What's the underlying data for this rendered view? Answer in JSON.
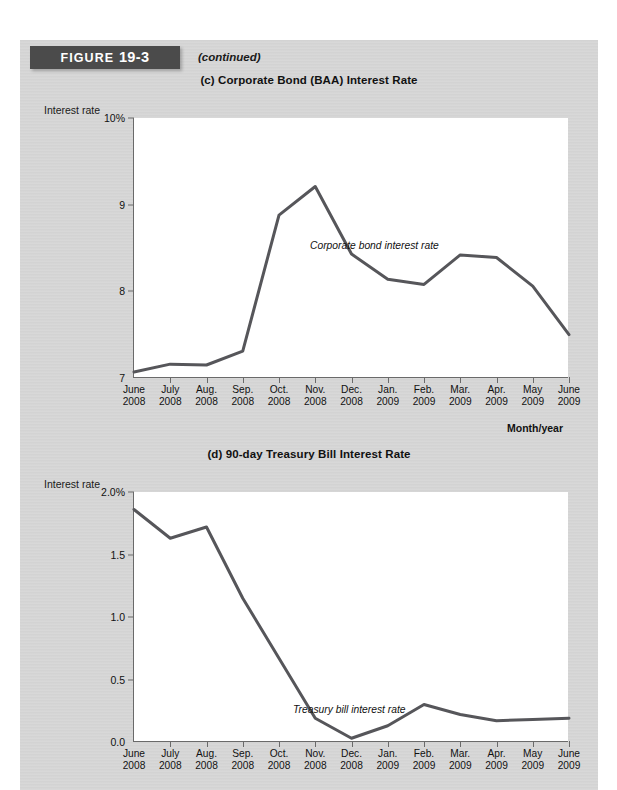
{
  "figure": {
    "header_prefix": "FIGURE ",
    "header_number": "19-3",
    "continued_label": "(continued)"
  },
  "chart_data": [
    {
      "id": "c",
      "type": "line",
      "title": "(c) Corporate Bond (BAA) Interest Rate",
      "ylabel": "Interest rate",
      "xlabel": "Month/year",
      "annotation": "Corporate bond interest rate",
      "ylim": [
        7,
        10
      ],
      "yticks": [
        10,
        9,
        8,
        7
      ],
      "ytick_labels": [
        "10%",
        "9",
        "8",
        "7"
      ],
      "grid": false,
      "legend": "none",
      "line_color": "#56565a",
      "categories": [
        "June 2008",
        "July 2008",
        "Aug. 2008",
        "Sep. 2008",
        "Oct. 2008",
        "Nov. 2008",
        "Dec. 2008",
        "Jan. 2009",
        "Feb. 2009",
        "Mar. 2009",
        "Apr. 2009",
        "May 2009",
        "June 2009"
      ],
      "x_top": [
        "June",
        "July",
        "Aug.",
        "Sep.",
        "Oct.",
        "Nov.",
        "Dec.",
        "Jan.",
        "Feb.",
        "Mar.",
        "Apr.",
        "May",
        "June"
      ],
      "x_bottom": [
        "2008",
        "2008",
        "2008",
        "2008",
        "2008",
        "2008",
        "2008",
        "2009",
        "2009",
        "2009",
        "2009",
        "2009",
        "2009"
      ],
      "values": [
        7.07,
        7.16,
        7.15,
        7.31,
        8.88,
        9.21,
        8.43,
        8.14,
        8.08,
        8.42,
        8.39,
        8.06,
        7.5
      ]
    },
    {
      "id": "d",
      "type": "line",
      "title": "(d) 90-day Treasury Bill Interest Rate",
      "ylabel": "Interest rate",
      "xlabel": "",
      "annotation": "Treasury bill interest rate",
      "ylim": [
        0,
        2.0
      ],
      "yticks": [
        2.0,
        1.5,
        1.0,
        0.5,
        0.0
      ],
      "ytick_labels": [
        "2.0%",
        "1.5",
        "1.0",
        "0.5",
        "0.0"
      ],
      "grid": false,
      "legend": "none",
      "line_color": "#56565a",
      "categories": [
        "June 2008",
        "July 2008",
        "Aug. 2008",
        "Sep. 2008",
        "Oct. 2008",
        "Nov. 2008",
        "Dec. 2008",
        "Jan. 2009",
        "Feb. 2009",
        "Mar. 2009",
        "Apr. 2009",
        "May 2009",
        "June 2009"
      ],
      "x_top": [
        "June",
        "July",
        "Aug.",
        "Sep.",
        "Oct.",
        "Nov.",
        "Dec.",
        "Jan.",
        "Feb.",
        "Mar.",
        "Apr.",
        "May",
        "June"
      ],
      "x_bottom": [
        "2008",
        "2008",
        "2008",
        "2008",
        "2008",
        "2008",
        "2008",
        "2009",
        "2009",
        "2009",
        "2009",
        "2009",
        "2009"
      ],
      "values": [
        1.86,
        1.63,
        1.72,
        1.15,
        0.67,
        0.19,
        0.03,
        0.13,
        0.3,
        0.22,
        0.17,
        0.18,
        0.19
      ]
    }
  ]
}
